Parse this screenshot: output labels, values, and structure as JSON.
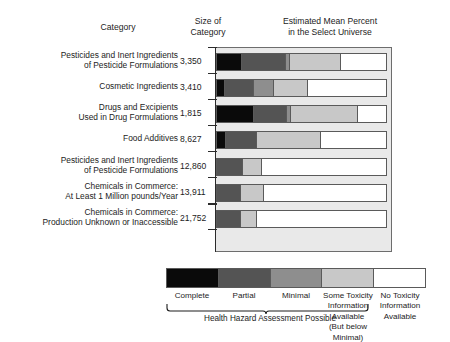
{
  "headers": {
    "category": "Category",
    "size_line1": "Size of",
    "size_line2": "Category",
    "percent_line1": "Estimated Mean Percent",
    "percent_line2": "in the Select Universe"
  },
  "legend": {
    "items": [
      {
        "label": "Complete",
        "color": "#0a0a0a"
      },
      {
        "label": "Partial",
        "color": "#545454"
      },
      {
        "label": "Minimal",
        "color": "#8e8e8e"
      },
      {
        "label": "Some Toxicity\nInformation\nAvailable\n(But below Minimal)",
        "color": "#c8c8c8"
      },
      {
        "label": "No Toxicity\nInformation\nAvailable",
        "color": "#ffffff"
      }
    ],
    "labels": [
      "Complete",
      "Partial",
      "Minimal",
      "Some Toxicity Information Available (But below Minimal)",
      "No Toxicity Information Available"
    ],
    "some_toxicity_l1": "Some Toxicity",
    "some_toxicity_l2": "Information",
    "some_toxicity_l3": "Available",
    "some_toxicity_l4": "(But below Minimal)",
    "no_toxicity_l1": "No Toxicity",
    "no_toxicity_l2": "Information",
    "no_toxicity_l3": "Available",
    "brace_caption": "Health Hazard Assessment Possible"
  },
  "chart_data": {
    "type": "bar",
    "orientation": "horizontal",
    "stacked": true,
    "title": "Estimated Mean Percent in the Select Universe",
    "xlabel": "Estimated Mean Percent in the Select Universe",
    "ylabel": "Category",
    "xlim": [
      0,
      100
    ],
    "grid": false,
    "legend_position": "bottom",
    "series": [
      {
        "name": "Complete",
        "color": "#0a0a0a",
        "values": [
          14.5,
          4.5,
          22,
          5,
          0,
          0,
          0
        ]
      },
      {
        "name": "Partial",
        "color": "#545454",
        "values": [
          26,
          17,
          19,
          18,
          15,
          14,
          13.5
        ]
      },
      {
        "name": "Minimal",
        "color": "#8e8e8e",
        "values": [
          2,
          11.5,
          2,
          0,
          0,
          0,
          0
        ]
      },
      {
        "name": "Some Toxicity Information Available (But below Minimal)",
        "color": "#c8c8c8",
        "values": [
          30.5,
          20,
          40,
          38,
          11,
          13,
          9.5
        ]
      },
      {
        "name": "No Toxicity Information Available",
        "color": "#ffffff",
        "values": [
          27,
          47,
          17,
          39,
          74,
          73,
          77
        ]
      }
    ],
    "categories": [
      "Pesticides and Inert Ingredients of Pesticide Formulations",
      "Cosmetic Ingredients",
      "Drugs and Excipients Used in Drug Formulations",
      "Food Additives",
      "Pesticides and Inert Ingredients of Pesticide Formulations",
      "Chemicals in Commerce: At Least 1 Million pounds/Year",
      "Chemicals in Commerce: Production Unknown or Inaccessible"
    ],
    "sizes": [
      "3,350",
      "3,410",
      "1,815",
      "8,627",
      "12,860",
      "13,911",
      "21,752"
    ]
  },
  "rows": [
    {
      "label_l1": "Pesticides and Inert Ingredients",
      "label_l2": "of Pesticide Formulations",
      "size": "3,350"
    },
    {
      "label_l1": "Cosmetic Ingredients",
      "label_l2": "",
      "size": "3,410"
    },
    {
      "label_l1": "Drugs and Excipients",
      "label_l2": "Used in Drug Formulations",
      "size": "1,815"
    },
    {
      "label_l1": "Food Additives",
      "label_l2": "",
      "size": "8,627"
    },
    {
      "label_l1": "Pesticides and Inert Ingredients",
      "label_l2": "of Pesticide Formulations",
      "size": "12,860"
    },
    {
      "label_l1": "Chemicals in Commerce:",
      "label_l2": "At Least 1 Million pounds/Year",
      "size": "13,911"
    },
    {
      "label_l1": "Chemicals in Commerce:",
      "label_l2": "Production Unknown or Inaccessible",
      "size": "21,752"
    }
  ]
}
